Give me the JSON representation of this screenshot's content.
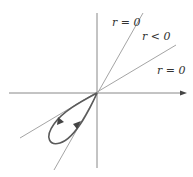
{
  "diagram": {
    "labels": {
      "upper_line": "r = 0",
      "between_region": "r < 0",
      "lower_line": "r = 0"
    },
    "colors": {
      "axis": "#7a7a7a",
      "tangent_lines": "#9a9a9a",
      "curve": "#5a5a5a",
      "arrow_head": "#444444",
      "text": "#333333"
    },
    "axes": {
      "horizontal_arrow": true,
      "vertical_arrow": false
    },
    "curve_direction_arrows": 2
  }
}
